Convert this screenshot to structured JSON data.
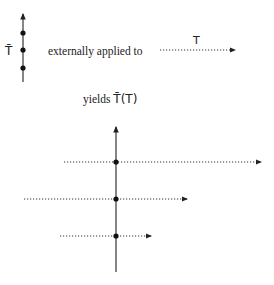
{
  "diagram": {
    "source_label": "T̄",
    "connector_text": "externally applied to",
    "applied_label": "T",
    "result_prefix": "yields ",
    "result_label": "T̄(T)"
  },
  "colors": {
    "ink": "#222222",
    "dotted": "#333333"
  },
  "small_axis": {
    "x": 23,
    "top": 13,
    "bottom": 82,
    "dots_y": [
      33,
      50,
      68
    ]
  },
  "applied_arrow": {
    "x1": 160,
    "x2": 236,
    "y": 50
  },
  "big_axis": {
    "x": 116,
    "top": 126,
    "bottom": 272,
    "rays": [
      {
        "x1": 64,
        "x2": 262,
        "y": 162
      },
      {
        "x1": 24,
        "x2": 188,
        "y": 199
      },
      {
        "x1": 60,
        "x2": 152,
        "y": 236
      }
    ]
  }
}
